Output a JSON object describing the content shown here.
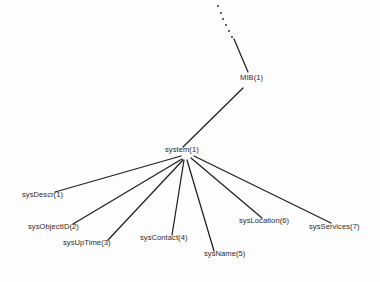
{
  "diagram": {
    "type": "tree",
    "background_color": "#fdfdfd",
    "line_color": "#1f1f1f",
    "text_color": "#2b2b2b",
    "nodes": [
      {
        "id": "mib",
        "label": "MIB(1)",
        "x": 240,
        "y": 80,
        "role": "parent"
      },
      {
        "id": "system",
        "label": "system(1)",
        "x": 165,
        "y": 152,
        "role": "parent"
      },
      {
        "id": "sys_descr",
        "label": "sysDescr(1)",
        "x": 22,
        "y": 197,
        "role": "leaf"
      },
      {
        "id": "sys_object_id",
        "label": "sysObjectID(2)",
        "x": 28,
        "y": 229,
        "role": "leaf"
      },
      {
        "id": "sys_uptime",
        "label": "sysUpTime(3)",
        "x": 63,
        "y": 245,
        "role": "leaf"
      },
      {
        "id": "sys_contact",
        "label": "sysContact(4)",
        "x": 140,
        "y": 240,
        "role": "leaf"
      },
      {
        "id": "sys_name",
        "label": "sysName(5)",
        "x": 204,
        "y": 256,
        "role": "leaf"
      },
      {
        "id": "sys_location",
        "label": "sysLocation(6)",
        "x": 239,
        "y": 223,
        "role": "leaf"
      },
      {
        "id": "sys_services",
        "label": "sysServices(7)",
        "x": 309,
        "y": 229,
        "role": "leaf"
      }
    ],
    "edges": [
      {
        "from": "ancestor",
        "to": "mib",
        "style": "dashed",
        "x1": 218,
        "y1": 6,
        "x2": 233,
        "y2": 38
      },
      {
        "from": "ancestor",
        "to": "mib",
        "style": "solid",
        "x1": 234,
        "y1": 39,
        "x2": 248,
        "y2": 72
      },
      {
        "from": "mib",
        "to": "system",
        "style": "solid",
        "x1": 243,
        "y1": 88,
        "x2": 183,
        "y2": 147
      },
      {
        "from": "system",
        "to": "sys_descr",
        "style": "solid",
        "x1": 181,
        "y1": 156,
        "x2": 55,
        "y2": 192
      },
      {
        "from": "system",
        "to": "sys_object_id",
        "style": "solid",
        "x1": 182,
        "y1": 159,
        "x2": 73,
        "y2": 224
      },
      {
        "from": "system",
        "to": "sys_uptime",
        "style": "solid",
        "x1": 183,
        "y1": 160,
        "x2": 108,
        "y2": 240
      },
      {
        "from": "system",
        "to": "sys_contact",
        "style": "solid",
        "x1": 184,
        "y1": 160,
        "x2": 172,
        "y2": 235
      },
      {
        "from": "system",
        "to": "sys_name",
        "style": "solid",
        "x1": 187,
        "y1": 160,
        "x2": 214,
        "y2": 251
      },
      {
        "from": "system",
        "to": "sys_location",
        "style": "solid",
        "x1": 191,
        "y1": 158,
        "x2": 262,
        "y2": 218
      },
      {
        "from": "system",
        "to": "sys_services",
        "style": "solid",
        "x1": 194,
        "y1": 156,
        "x2": 331,
        "y2": 223
      }
    ],
    "dots": [
      {
        "x": 218,
        "y": 6
      },
      {
        "x": 221,
        "y": 13
      },
      {
        "x": 223,
        "y": 19
      },
      {
        "x": 226,
        "y": 25
      },
      {
        "x": 229,
        "y": 31
      },
      {
        "x": 232,
        "y": 37
      }
    ]
  }
}
